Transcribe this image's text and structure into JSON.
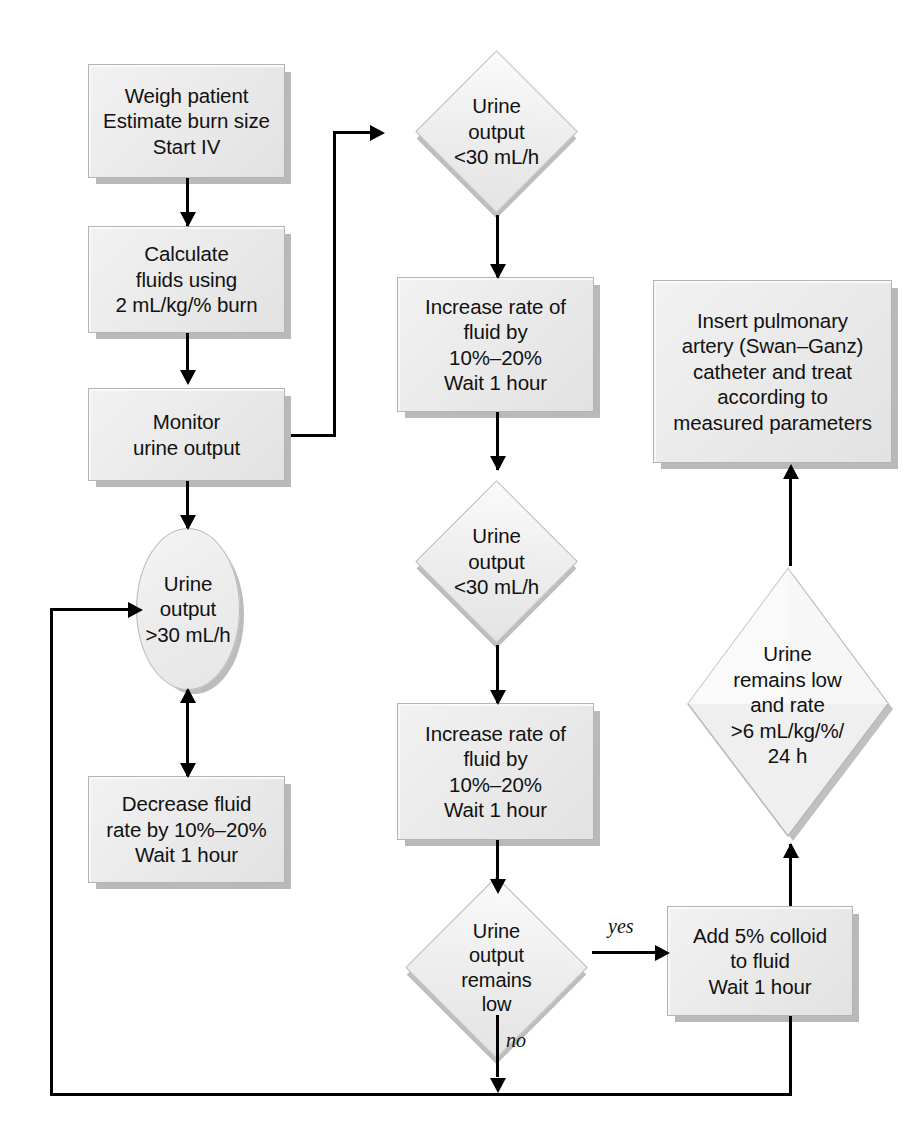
{
  "diagram": {
    "nodes": [
      {
        "id": "weigh",
        "type": "process",
        "text": "Weigh patient\nEstimate burn size\nStart IV"
      },
      {
        "id": "calculate",
        "type": "process",
        "text": "Calculate\nfluids using\n2 mL/kg/% burn"
      },
      {
        "id": "monitor",
        "type": "process",
        "text": "Monitor\nurine output"
      },
      {
        "id": "urine_high",
        "type": "state",
        "text": "Urine\noutput\n>30 mL/h"
      },
      {
        "id": "decrease",
        "type": "process",
        "text": "Decrease fluid\nrate by 10%–20%\nWait 1 hour"
      },
      {
        "id": "decision1",
        "type": "decision",
        "text": "Urine\noutput\n<30 mL/h"
      },
      {
        "id": "increase1",
        "type": "process",
        "text": "Increase rate of\nfluid by\n10%–20%\nWait 1 hour"
      },
      {
        "id": "decision2",
        "type": "decision",
        "text": "Urine\noutput\n<30 mL/h"
      },
      {
        "id": "increase2",
        "type": "process",
        "text": "Increase rate of\nfluid by\n10%–20%\nWait 1 hour"
      },
      {
        "id": "decision3",
        "type": "decision",
        "text": "Urine\noutput\nremains\nlow"
      },
      {
        "id": "colloid",
        "type": "process",
        "text": "Add 5% colloid\nto fluid\nWait 1 hour"
      },
      {
        "id": "decision4",
        "type": "decision",
        "text": "Urine\nremains low\nand rate\n>6 mL/kg/%/\n24 h"
      },
      {
        "id": "swanganz",
        "type": "process",
        "text": "Insert pulmonary\nartery (Swan–Ganz)\ncatheter and treat\naccording to\nmeasured parameters"
      }
    ],
    "edge_labels": {
      "yes": "yes",
      "no": "no"
    },
    "colors": {
      "node_fill": "#ededed",
      "node_border": "#b6b6b6",
      "node_shadow": "#bbbbbb",
      "connector": "#000000",
      "text": "#111111",
      "background": "#ffffff"
    }
  }
}
